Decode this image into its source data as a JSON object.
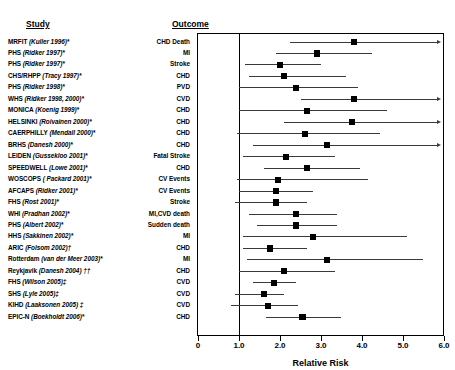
{
  "headers": {
    "study": "Study",
    "outcome": "Outcome"
  },
  "axis": {
    "title": "Relative Risk",
    "ticks": [
      "0",
      "1.0",
      "2.0",
      "3.0",
      "4.0",
      "5.0",
      "6.0"
    ],
    "tick_values": [
      0,
      1,
      2,
      3,
      4,
      5,
      6
    ],
    "reference_line": 1.0,
    "xmin": 0,
    "xmax": 6.3
  },
  "colors": {
    "marker": "#000000",
    "line": "#3a3a3a",
    "frame": "#000000",
    "text": "#000000"
  },
  "chart_data": {
    "type": "scatter",
    "title": "",
    "xlabel": "Relative Risk",
    "ylabel": "",
    "xlim": [
      0,
      6.3
    ],
    "grid": false,
    "legend": null,
    "reference_line": 1.0,
    "categories": [
      "MRFIT (Kuller 1996)*",
      "PHS (Ridker 1997)*",
      "PHS (Ridker 1997)*",
      "CHS/RHPP (Tracy 1997)*",
      "PHS (Ridker 1998)*",
      "WHS (Ridker 1998, 2000)*",
      "MONICA (Koenig 1999)*",
      "HELSINKI (Roivainen 2000)*",
      "CAERPHILLY (Mendall 2000)*",
      "BRHS (Danesh 2000)*",
      "LEIDEN (Gussekloo 2001)*",
      "SPEEDWELL (Lowe 2001)*",
      "WOSCOPS ( Packard 2001)*",
      "AFCAPS (Ridker 2001)*",
      "FHS (Rost 2001)*",
      "WHI (Pradhan 2002)*",
      "PHS (Albert 2002)*",
      "HHS (Sakkinen 2002)*",
      "ARIC (Folsom 2002)†",
      "Rotterdam (van der Meer 2003)*",
      "Reykjavik (Danesh 2004) ††",
      "FHS (Wilson 2005)‡",
      "SHS (Lyle 2005)‡",
      "KIHD (Laaksonen 2005) ‡",
      "EPIC-N (Boekholdt 2006)*"
    ],
    "rows": [
      {
        "study_name": "MRFIT",
        "study_ref": "(Kuller  1996)*",
        "outcome": "CHD Death",
        "rr": 3.8,
        "lo": 2.25,
        "hi": 6.3,
        "hi_open": true
      },
      {
        "study_name": "PHS",
        "study_ref": "(Ridker 1997)*",
        "outcome": "MI",
        "rr": 2.9,
        "lo": 1.9,
        "hi": 4.25,
        "hi_open": false
      },
      {
        "study_name": "PHS",
        "study_ref": "(Ridker 1997)*",
        "outcome": "Stroke",
        "rr": 2.0,
        "lo": 1.15,
        "hi": 3.0,
        "hi_open": false
      },
      {
        "study_name": "CHS/RHPP",
        "study_ref": "(Tracy 1997)*",
        "outcome": "CHD",
        "rr": 2.1,
        "lo": 1.25,
        "hi": 3.6,
        "hi_open": false
      },
      {
        "study_name": "PHS",
        "study_ref": "(Ridker 1998)*",
        "outcome": "PVD",
        "rr": 2.4,
        "lo": 1.0,
        "hi": 3.9,
        "hi_open": false
      },
      {
        "study_name": "WHS",
        "study_ref": "(Ridker 1998, 2000)*",
        "outcome": "CVD",
        "rr": 3.8,
        "lo": 2.5,
        "hi": 6.3,
        "hi_open": true
      },
      {
        "study_name": "MONICA",
        "study_ref": "(Koenig 1999)*",
        "outcome": "CHD",
        "rr": 2.65,
        "lo": 1.0,
        "hi": 4.6,
        "hi_open": false
      },
      {
        "study_name": "HELSINKI",
        "study_ref": "(Roivainen 2000)*",
        "outcome": "CHD",
        "rr": 3.75,
        "lo": 2.1,
        "hi": 6.3,
        "hi_open": true
      },
      {
        "study_name": "CAERPHILLY",
        "study_ref": "(Mendall 2000)*",
        "outcome": "CHD",
        "rr": 2.6,
        "lo": 0.95,
        "hi": 4.45,
        "hi_open": false
      },
      {
        "study_name": "BRHS",
        "study_ref": "(Danesh 2000)*",
        "outcome": "CHD",
        "rr": 3.15,
        "lo": 1.35,
        "hi": 6.3,
        "hi_open": true
      },
      {
        "study_name": "LEIDEN",
        "study_ref": "(Gussekloo  2001)*",
        "outcome": "Fatal Stroke",
        "rr": 2.15,
        "lo": 1.1,
        "hi": 3.35,
        "hi_open": false
      },
      {
        "study_name": "SPEEDWELL",
        "study_ref": "(Lowe 2001)*",
        "outcome": "CHD",
        "rr": 2.65,
        "lo": 1.6,
        "hi": 3.95,
        "hi_open": false
      },
      {
        "study_name": "WOSCOPS",
        "study_ref": "( Packard 2001)*",
        "outcome": "CV Events",
        "rr": 1.95,
        "lo": 0.95,
        "hi": 4.15,
        "hi_open": false
      },
      {
        "study_name": "AFCAPS",
        "study_ref": "(Ridker 2001)*",
        "outcome": "CV Events",
        "rr": 1.9,
        "lo": 1.0,
        "hi": 2.8,
        "hi_open": false
      },
      {
        "study_name": "FHS",
        "study_ref": "(Rost 2001)*",
        "outcome": "Stroke",
        "rr": 1.9,
        "lo": 0.9,
        "hi": 2.65,
        "hi_open": false
      },
      {
        "study_name": "WHI",
        "study_ref": "(Pradhan 2002)*",
        "outcome": "MI,CVD death",
        "rr": 2.4,
        "lo": 1.25,
        "hi": 3.4,
        "hi_open": false
      },
      {
        "study_name": "PHS",
        "study_ref": "(Albert 2002)*",
        "outcome": "Sudden death",
        "rr": 2.4,
        "lo": 1.45,
        "hi": 3.4,
        "hi_open": false
      },
      {
        "study_name": "HHS",
        "study_ref": "(Sakkinen 2002)*",
        "outcome": "MI",
        "rr": 2.8,
        "lo": 1.1,
        "hi": 5.1,
        "hi_open": false
      },
      {
        "study_name": "ARIC",
        "study_ref": "(Folsom 2002)†",
        "outcome": "CHD",
        "rr": 1.75,
        "lo": 1.1,
        "hi": 2.65,
        "hi_open": false
      },
      {
        "study_name": "Rotterdam",
        "study_ref": "(van der Meer 2003)*",
        "outcome": "MI",
        "rr": 3.15,
        "lo": 1.2,
        "hi": 5.5,
        "hi_open": false
      },
      {
        "study_name": "Reykjavik",
        "study_ref": "(Danesh 2004) ††",
        "outcome": "CHD",
        "rr": 2.1,
        "lo": 1.0,
        "hi": 3.35,
        "hi_open": false
      },
      {
        "study_name": "FHS",
        "study_ref": "(Wilson 2005)‡",
        "outcome": "CVD",
        "rr": 1.85,
        "lo": 1.35,
        "hi": 2.4,
        "hi_open": false
      },
      {
        "study_name": "SHS",
        "study_ref": "(Lyle 2005)‡",
        "outcome": "CVD",
        "rr": 1.6,
        "lo": 0.9,
        "hi": 2.1,
        "hi_open": false
      },
      {
        "study_name": "KIHD",
        "study_ref": "(Laaksonen 2005) ‡",
        "outcome": "CVD",
        "rr": 1.7,
        "lo": 0.8,
        "hi": 2.45,
        "hi_open": false
      },
      {
        "study_name": "EPIC-N",
        "study_ref": "(Boekholdt 2006)*",
        "outcome": "CHD",
        "rr": 2.55,
        "lo": 1.65,
        "hi": 3.5,
        "hi_open": false
      }
    ]
  }
}
